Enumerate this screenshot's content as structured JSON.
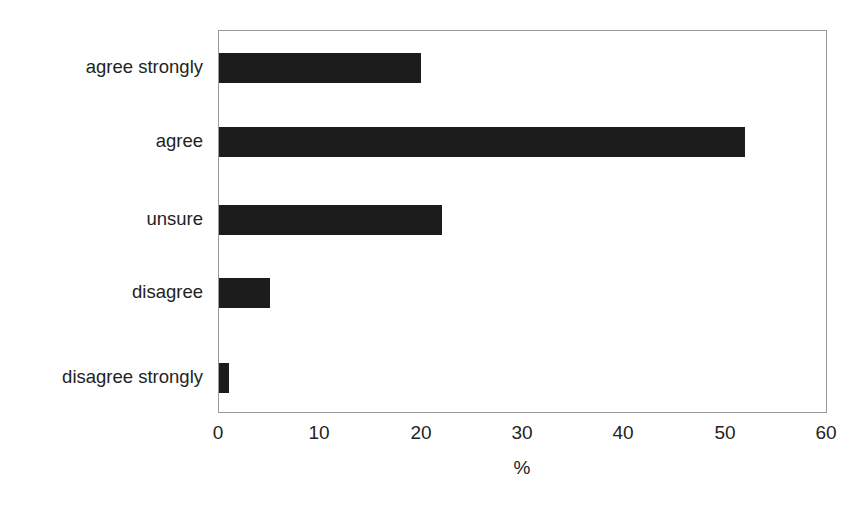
{
  "chart_data": {
    "type": "bar",
    "orientation": "horizontal",
    "title": "",
    "subtitle": "",
    "xlabel": "%",
    "ylabel": "",
    "categories": [
      "agree strongly",
      "agree",
      "unsure",
      "disagree",
      "disagree strongly"
    ],
    "values": [
      20,
      52,
      22,
      5,
      1
    ],
    "series": [
      {
        "name": "",
        "values": [
          20,
          52,
          22,
          5,
          1
        ]
      }
    ],
    "xlim": [
      0,
      60
    ],
    "xticks": [
      0,
      10,
      20,
      30,
      40,
      50,
      60
    ],
    "xticklabels": [
      "0",
      "10",
      "20",
      "30",
      "40",
      "50",
      "60"
    ],
    "grid": false,
    "legend": false,
    "legend_position": "none",
    "annotations": [],
    "colors": {
      "bar": "#1c1c1c",
      "frame": "#9a9a9a",
      "background": "#ffffff",
      "text": "#232323"
    }
  }
}
